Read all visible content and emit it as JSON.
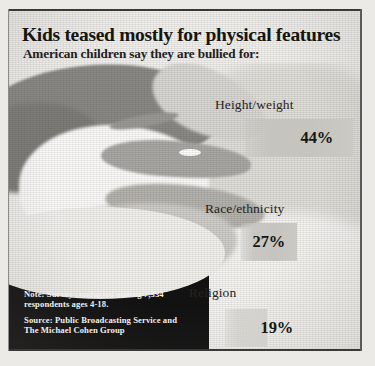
{
  "graphic": {
    "title": "Kids teased mostly for physical features",
    "subtitle": "American children say they are bullied for:",
    "note": "Note: Survey conducted among  7,334 respondents ages 4-18.",
    "source": "Source: Public Broadcasting Service and The Michael Cohen Group"
  },
  "chart_data": {
    "type": "bar",
    "title": "Kids teased mostly for physical features",
    "subtitle": "American children say they are bullied for:",
    "categories": [
      "Height/weight",
      "Race/ethnicity",
      "Religion"
    ],
    "values": [
      44,
      27,
      19
    ],
    "value_labels": [
      "44%",
      "27%",
      "19%"
    ],
    "unit": "%",
    "xlabel": "",
    "ylabel": "",
    "xlim": [
      0,
      50
    ],
    "grid": false,
    "legend": false,
    "orientation": "horizontal",
    "bar_color": "#c6c4bf",
    "note": "Note: Survey conducted among  7,334 respondents ages 4-18.",
    "source": "Source: Public Broadcasting Service and The Michael Cohen Group",
    "respondents": "7,334",
    "ages": "4-18"
  }
}
